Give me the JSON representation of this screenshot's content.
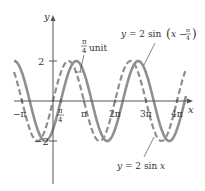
{
  "chart_data": {
    "type": "line",
    "title": "",
    "xlabel": "x",
    "ylabel": "y",
    "x_ticks": [
      "-π",
      "π/4",
      "π",
      "2π",
      "3π",
      "4π"
    ],
    "y_ticks": [
      "2",
      "-2"
    ],
    "xlim": [
      -3.5,
      13.2
    ],
    "ylim": [
      -2.5,
      2.5
    ],
    "grid": false,
    "series": [
      {
        "name": "y = 2 sin(x − π/4)",
        "expr": "2*sin(x - pi/4)",
        "style": "solid",
        "color": "#8a8a8a",
        "amplitude": 2,
        "phase_shift": 0.7854
      },
      {
        "name": "y = 2 sin x",
        "expr": "2*sin(x)",
        "style": "dashed",
        "color": "#8a8a8a",
        "amplitude": 2,
        "phase_shift": 0
      }
    ],
    "annotations": [
      {
        "text": "π/4 unit",
        "meaning": "horizontal shift between curves"
      },
      {
        "text": "y = 2 sin(x − π/4)",
        "points_to": "solid curve"
      },
      {
        "text": "y = 2 sin x",
        "points_to": "dashed curve"
      }
    ]
  },
  "labels": {
    "y_axis": "y",
    "x_axis": "x",
    "y_pos": "2",
    "y_neg": "−2",
    "x_negpi": "−π",
    "x_pi4_num": "π",
    "x_pi4_den": "4",
    "x_pi": "π",
    "x_2pi": "2π",
    "x_3pi": "3π",
    "x_4pi": "4π",
    "shift_num": "π",
    "shift_den": "4",
    "shift_unit": "unit",
    "shifted_eq_prefix": "y = 2  sin",
    "shifted_eq_inner": "x −",
    "shifted_eq_num": "π",
    "shifted_eq_den": "4",
    "base_eq": "y = 2  sin x"
  },
  "colors": {
    "curve": "#8f8f8f",
    "axis": "#555555",
    "text": "#333333"
  }
}
